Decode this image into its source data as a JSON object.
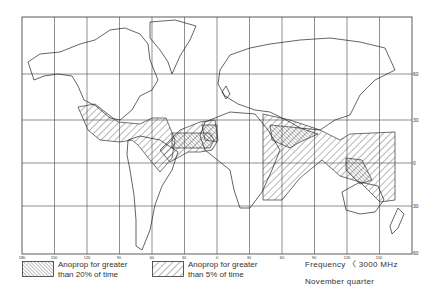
{
  "map": {
    "title": "Anoprop occurrence map",
    "longitude_ticks": [
      "180",
      "150",
      "120",
      "90",
      "60",
      "30",
      "0",
      "30",
      "60",
      "90",
      "120",
      "150"
    ],
    "latitude_labels": [
      {
        "label": "60",
        "y": 74
      },
      {
        "label": "30",
        "y": 120
      },
      {
        "label": "0",
        "y": 163
      },
      {
        "label": "30",
        "y": 206
      },
      {
        "label": "60",
        "y": 253
      }
    ]
  },
  "legend": {
    "items": [
      {
        "pattern": "dense-hatch-backslash",
        "line1": "Anoprop for greater",
        "line2": "than 20% of time"
      },
      {
        "pattern": "sparse-hatch-slash",
        "line1": "Anoprop for greater",
        "line2": "than 5% of time"
      }
    ]
  },
  "notes": {
    "frequency": "Frequency 〈 3000 MHz",
    "season": "November  quarter"
  },
  "colors": {
    "ink": "#2a2a2a",
    "background": "#ffffff"
  }
}
